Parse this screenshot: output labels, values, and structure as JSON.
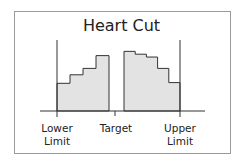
{
  "title": "Heart Cut",
  "labels": {
    "lower": [
      "Lower",
      "Limit"
    ],
    "target": "Target",
    "upper": [
      "Upper",
      "Limit"
    ]
  },
  "colors": {
    "fill": "#e3e3e3",
    "stroke": "#333333",
    "frame": "#9a9a9a"
  },
  "diagram": {
    "left_steps": [
      0.39,
      0.51,
      0.6,
      0.78
    ],
    "right_steps": [
      0.84,
      0.8,
      0.76,
      0.6,
      0.4
    ]
  }
}
